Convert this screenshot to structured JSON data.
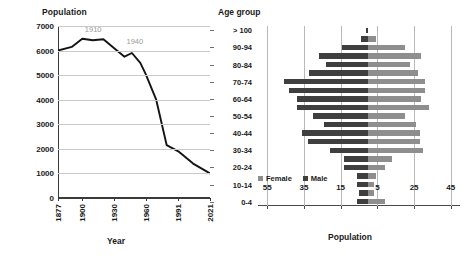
{
  "chart_data": [
    {
      "type": "line",
      "title": "",
      "ylabel": "Population",
      "xlabel": "Year",
      "ylim": [
        0,
        7000
      ],
      "ytick_labels": [
        "0",
        "1000",
        "2000",
        "3000",
        "4000",
        "5000",
        "6000",
        "7000"
      ],
      "yticks": [
        0,
        1000,
        2000,
        3000,
        4000,
        5000,
        6000,
        7000
      ],
      "xtick_labels": [
        "1877",
        "1900",
        "1930",
        "1960",
        "1991",
        "2021"
      ],
      "grid": true,
      "legend": "none",
      "annotations": [
        {
          "text": "1910",
          "x": 1910,
          "y": 6500
        },
        {
          "text": "1940",
          "x": 1940,
          "y": 5750
        }
      ],
      "x": [
        1877,
        1890,
        1900,
        1910,
        1920,
        1930,
        1940,
        1947,
        1955,
        1960,
        1970,
        1980,
        1991,
        2005,
        2021
      ],
      "values": [
        6000,
        6150,
        6480,
        6420,
        6460,
        6100,
        5750,
        5900,
        5500,
        5050,
        4000,
        2150,
        1900,
        1400,
        1000
      ],
      "series_name": "Population"
    },
    {
      "type": "bar",
      "subtype": "population-pyramid",
      "title": "",
      "ylabel": "Age group",
      "xlabel": "Population",
      "xtick_labels": [
        "55",
        "35",
        "15",
        "5",
        "25",
        "45"
      ],
      "xticks": [
        55,
        35,
        15,
        5,
        25,
        45
      ],
      "axis_zero_value": 10,
      "grid": true,
      "legend": [
        "Female",
        "Male"
      ],
      "legend_position": "bottom-left",
      "categories": [
        "> 100",
        "95-99",
        "90-94",
        "85-89",
        "80-84",
        "75-79",
        "70-74",
        "65-69",
        "60-64",
        "55-59",
        "50-54",
        "45-49",
        "40-44",
        "35-39",
        "30-34",
        "25-29",
        "20-24",
        "15-19",
        "10-14",
        "5-9",
        "0-4"
      ],
      "visible_category_labels": [
        "> 100",
        "",
        "90-94",
        "",
        "80-84",
        "",
        "70-74",
        "",
        "60-64",
        "",
        "50-54",
        "",
        "40-44",
        "",
        "30-34",
        "",
        "20-24",
        "",
        "10-14",
        "",
        "0-4"
      ],
      "series": [
        {
          "name": "Male",
          "color": "#3f3f3f",
          "values": [
            1,
            4,
            14,
            27,
            23,
            32,
            46,
            43,
            39,
            39,
            30,
            24,
            36,
            33,
            21,
            13,
            13,
            6,
            6,
            5,
            6
          ]
        },
        {
          "name": "Female",
          "color": "#8e8e8e",
          "values": [
            0,
            4,
            20,
            29,
            23,
            27,
            31,
            31,
            29,
            33,
            20,
            26,
            28,
            28,
            30,
            13,
            9,
            4,
            3,
            3,
            9
          ]
        }
      ]
    }
  ],
  "line_chart": {
    "y_axis_title": "Population",
    "x_axis_title": "Year",
    "y_ticks": [
      "7000",
      "6000",
      "5000",
      "4000",
      "3000",
      "2000",
      "1000",
      "0"
    ],
    "x_ticks": [
      "1877",
      "1900",
      "1930",
      "1960",
      "1991",
      "2021"
    ],
    "annotation_1910": "1910",
    "annotation_1940": "1940"
  },
  "pyramid_chart": {
    "y_axis_title": "Age group",
    "x_axis_title": "Population",
    "x_ticks": [
      "55",
      "35",
      "15",
      "5",
      "25",
      "45"
    ],
    "legend_female": "Female",
    "legend_male": "Male",
    "age_labels": [
      "> 100",
      "",
      "90-94",
      "",
      "80-84",
      "",
      "70-74",
      "",
      "60-64",
      "",
      "50-54",
      "",
      "40-44",
      "",
      "30-34",
      "",
      "20-24",
      "",
      "10-14",
      "",
      "0-4"
    ]
  },
  "colors": {
    "male": "#3f3f3f",
    "female": "#8e8e8e",
    "line": "#141414",
    "grid": "#c9c9c9",
    "annotation": "#9a9a9a"
  }
}
